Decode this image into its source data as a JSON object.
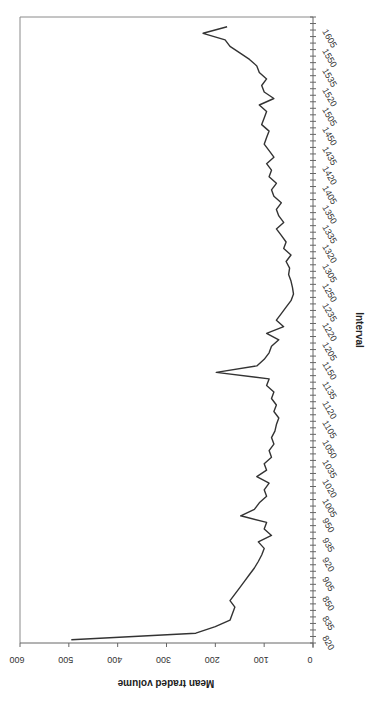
{
  "chart_data": {
    "type": "line",
    "orientation": "rotated-90-clockwise",
    "title": "",
    "xlabel": "Interval",
    "ylabel": "Mean traded volume",
    "ylim": [
      0,
      600
    ],
    "yticks": [
      0,
      100,
      200,
      300,
      400,
      500,
      600
    ],
    "xtick_labels": [
      "820",
      "835",
      "850",
      "905",
      "920",
      "935",
      "950",
      "1005",
      "1020",
      "1035",
      "1050",
      "1105",
      "1120",
      "1135",
      "1150",
      "1205",
      "1220",
      "1235",
      "1250",
      "1305",
      "1320",
      "1335",
      "1350",
      "1405",
      "1420",
      "1435",
      "1450",
      "1505",
      "1520",
      "1535",
      "1550",
      "1605"
    ],
    "grid": false,
    "legend": null,
    "line_color": "#333333",
    "categories": [
      "820",
      "825",
      "830",
      "835",
      "840",
      "845",
      "850",
      "855",
      "900",
      "905",
      "910",
      "915",
      "920",
      "925",
      "930",
      "935",
      "940",
      "945",
      "950",
      "955",
      "1000",
      "1005",
      "1010",
      "1015",
      "1020",
      "1025",
      "1030",
      "1035",
      "1040",
      "1045",
      "1050",
      "1055",
      "1100",
      "1105",
      "1110",
      "1115",
      "1120",
      "1125",
      "1130",
      "1135",
      "1140",
      "1145",
      "1150",
      "1155",
      "1200",
      "1205",
      "1210",
      "1215",
      "1220",
      "1225",
      "1230",
      "1235",
      "1240",
      "1245",
      "1250",
      "1255",
      "1300",
      "1305",
      "1310",
      "1315",
      "1320",
      "1325",
      "1330",
      "1335",
      "1340",
      "1345",
      "1350",
      "1355",
      "1400",
      "1405",
      "1410",
      "1415",
      "1420",
      "1425",
      "1430",
      "1435",
      "1440",
      "1445",
      "1450",
      "1455",
      "1500",
      "1505",
      "1510",
      "1515",
      "1520",
      "1525",
      "1530",
      "1535",
      "1540",
      "1545",
      "1550",
      "1555",
      "1600",
      "1605",
      "1610"
    ],
    "values": [
      495,
      240,
      200,
      170,
      165,
      160,
      170,
      160,
      150,
      140,
      130,
      120,
      112,
      105,
      100,
      112,
      85,
      100,
      95,
      148,
      120,
      110,
      95,
      100,
      90,
      115,
      95,
      100,
      85,
      90,
      80,
      85,
      78,
      75,
      70,
      80,
      75,
      85,
      80,
      95,
      90,
      198,
      115,
      100,
      90,
      85,
      70,
      95,
      60,
      75,
      65,
      55,
      45,
      40,
      42,
      45,
      50,
      48,
      55,
      45,
      60,
      55,
      65,
      75,
      60,
      70,
      75,
      65,
      80,
      85,
      75,
      90,
      85,
      95,
      80,
      90,
      100,
      95,
      90,
      105,
      100,
      95,
      110,
      80,
      100,
      105,
      95,
      110,
      115,
      130,
      150,
      170,
      180,
      225,
      176
    ]
  }
}
